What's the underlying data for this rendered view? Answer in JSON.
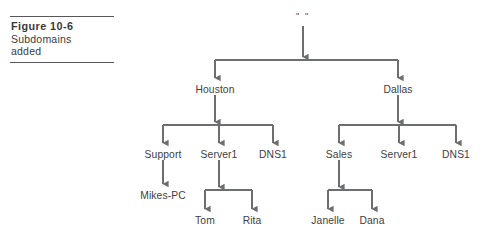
{
  "figure": {
    "number_label": "Figure 10-6",
    "description_line_1": "Subdomains",
    "description_line_2": "added"
  },
  "diagram": {
    "type": "tree",
    "edge_color": "#6d6e71",
    "text_color": "#414042",
    "nodes": [
      {
        "id": "root",
        "label": "\" \"",
        "x": 303,
        "y": 16,
        "level": 0
      },
      {
        "id": "houston",
        "label": "Houston",
        "x": 215,
        "y": 90,
        "level": 1
      },
      {
        "id": "dallas",
        "label": "Dallas",
        "x": 398,
        "y": 90,
        "level": 1
      },
      {
        "id": "support",
        "label": "Support",
        "x": 163,
        "y": 155,
        "level": 2
      },
      {
        "id": "h-server1",
        "label": "Server1",
        "x": 219,
        "y": 155,
        "level": 2
      },
      {
        "id": "h-dns1",
        "label": "DNS1",
        "x": 273,
        "y": 155,
        "level": 2
      },
      {
        "id": "sales",
        "label": "Sales",
        "x": 339,
        "y": 155,
        "level": 2
      },
      {
        "id": "d-server1",
        "label": "Server1",
        "x": 399,
        "y": 155,
        "level": 2
      },
      {
        "id": "d-dns1",
        "label": "DNS1",
        "x": 456,
        "y": 155,
        "level": 2
      },
      {
        "id": "mikes-pc",
        "label": "Mikes-PC",
        "x": 163,
        "y": 196,
        "level": 3
      },
      {
        "id": "tom",
        "label": "Tom",
        "x": 205,
        "y": 221,
        "level": 3
      },
      {
        "id": "rita",
        "label": "Rita",
        "x": 252,
        "y": 221,
        "level": 3
      },
      {
        "id": "janelle",
        "label": "Janelle",
        "x": 328,
        "y": 221,
        "level": 3
      },
      {
        "id": "dana",
        "label": "Dana",
        "x": 372,
        "y": 221,
        "level": 3
      }
    ],
    "edges": [
      {
        "from": "root",
        "to": "houston"
      },
      {
        "from": "root",
        "to": "dallas"
      },
      {
        "from": "houston",
        "to": "support"
      },
      {
        "from": "houston",
        "to": "h-server1"
      },
      {
        "from": "houston",
        "to": "h-dns1"
      },
      {
        "from": "dallas",
        "to": "sales"
      },
      {
        "from": "dallas",
        "to": "d-server1"
      },
      {
        "from": "dallas",
        "to": "d-dns1"
      },
      {
        "from": "support",
        "to": "mikes-pc"
      },
      {
        "from": "h-server1",
        "to": "tom"
      },
      {
        "from": "h-server1",
        "to": "rita"
      },
      {
        "from": "sales",
        "to": "janelle"
      },
      {
        "from": "sales",
        "to": "dana"
      }
    ]
  }
}
